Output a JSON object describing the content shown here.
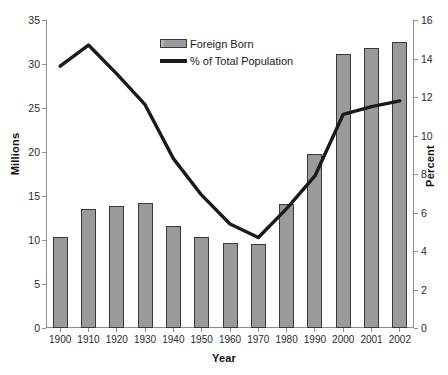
{
  "chart_data": {
    "type": "bar",
    "title": "",
    "xlabel": "Year",
    "ylabel": "Millions",
    "y2label": "Percent",
    "categories": [
      "1900",
      "1910",
      "1920",
      "1930",
      "1940",
      "1950",
      "1960",
      "1970",
      "1980",
      "1990",
      "2000",
      "2001",
      "2002"
    ],
    "ylim": [
      0,
      35
    ],
    "yticks": [
      "0",
      "5",
      "10",
      "15",
      "20",
      "25",
      "30",
      "35"
    ],
    "ytick_values": [
      0,
      5,
      10,
      15,
      20,
      25,
      30,
      35
    ],
    "y2lim": [
      0,
      16
    ],
    "y2ticks": [
      "0",
      "2",
      "4",
      "6",
      "8",
      "10",
      "12",
      "14",
      "16"
    ],
    "y2tick_values": [
      0,
      2,
      4,
      6,
      8,
      10,
      12,
      14,
      16
    ],
    "grid": false,
    "legend_position": "top-center",
    "series": [
      {
        "name": "Foreign Born",
        "type": "bar",
        "axis": "left",
        "unit": "millions",
        "color": "#9a9a9a",
        "edge_color": "#3a3a3a",
        "values": [
          10.3,
          13.5,
          13.9,
          14.2,
          11.6,
          10.3,
          9.7,
          9.6,
          14.1,
          19.8,
          31.1,
          31.8,
          32.5
        ]
      },
      {
        "name": "% of Total Population",
        "type": "line",
        "axis": "right",
        "unit": "percent",
        "color": "#1a1a1a",
        "values": [
          13.6,
          14.7,
          13.2,
          11.6,
          8.8,
          6.9,
          5.4,
          4.7,
          6.2,
          7.9,
          11.1,
          11.5,
          11.8
        ]
      }
    ]
  },
  "legend": {
    "items": [
      {
        "label": "Foreign Born",
        "swatch": "bar"
      },
      {
        "label": "% of Total Population",
        "swatch": "line"
      }
    ]
  }
}
